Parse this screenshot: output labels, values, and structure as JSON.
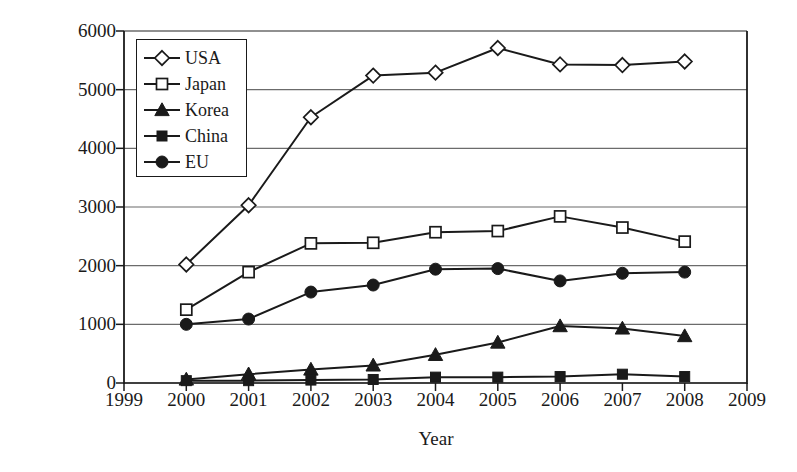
{
  "chart_data": {
    "type": "line",
    "title": "",
    "xlabel": "Year",
    "ylabel": "Number of Applications",
    "x": [
      2000,
      2001,
      2002,
      2003,
      2004,
      2005,
      2006,
      2007,
      2008
    ],
    "xlim": [
      1999,
      2009
    ],
    "ylim": [
      0,
      6000
    ],
    "x_ticks": [
      "1999",
      "2000",
      "2001",
      "2002",
      "2003",
      "2004",
      "2005",
      "2006",
      "2007",
      "2008",
      "2009"
    ],
    "y_ticks": [
      "0",
      "1000",
      "2000",
      "3000",
      "4000",
      "5000",
      "6000"
    ],
    "grid": "horizontal",
    "legend_position": "upper-left-inside",
    "series": [
      {
        "name": "USA",
        "marker": "diamond-open",
        "values": [
          2020,
          3030,
          4530,
          5240,
          5290,
          5710,
          5430,
          5420,
          5480
        ]
      },
      {
        "name": "Japan",
        "marker": "square-open",
        "values": [
          1250,
          1890,
          2380,
          2390,
          2570,
          2590,
          2840,
          2650,
          2410
        ]
      },
      {
        "name": "Korea",
        "marker": "triangle-filled",
        "values": [
          60,
          150,
          230,
          300,
          480,
          690,
          970,
          930,
          800
        ]
      },
      {
        "name": "China",
        "marker": "square-filled",
        "values": [
          40,
          40,
          50,
          60,
          100,
          100,
          110,
          150,
          110
        ]
      },
      {
        "name": "EU",
        "marker": "circle-filled",
        "values": [
          1000,
          1090,
          1550,
          1670,
          1940,
          1950,
          1740,
          1870,
          1890
        ]
      }
    ]
  },
  "legend": {
    "items": [
      {
        "label": "USA",
        "marker": "diamond-open"
      },
      {
        "label": "Japan",
        "marker": "square-open"
      },
      {
        "label": "Korea",
        "marker": "triangle-filled"
      },
      {
        "label": "China",
        "marker": "square-filled"
      },
      {
        "label": "EU",
        "marker": "circle-filled"
      }
    ]
  },
  "colors": {
    "line": "#1a1a1a",
    "grid": "#6b6b6b",
    "axis": "#1a1a1a",
    "background": "#ffffff",
    "marker_fill_open": "#ffffff",
    "marker_fill_solid": "#1a1a1a"
  }
}
